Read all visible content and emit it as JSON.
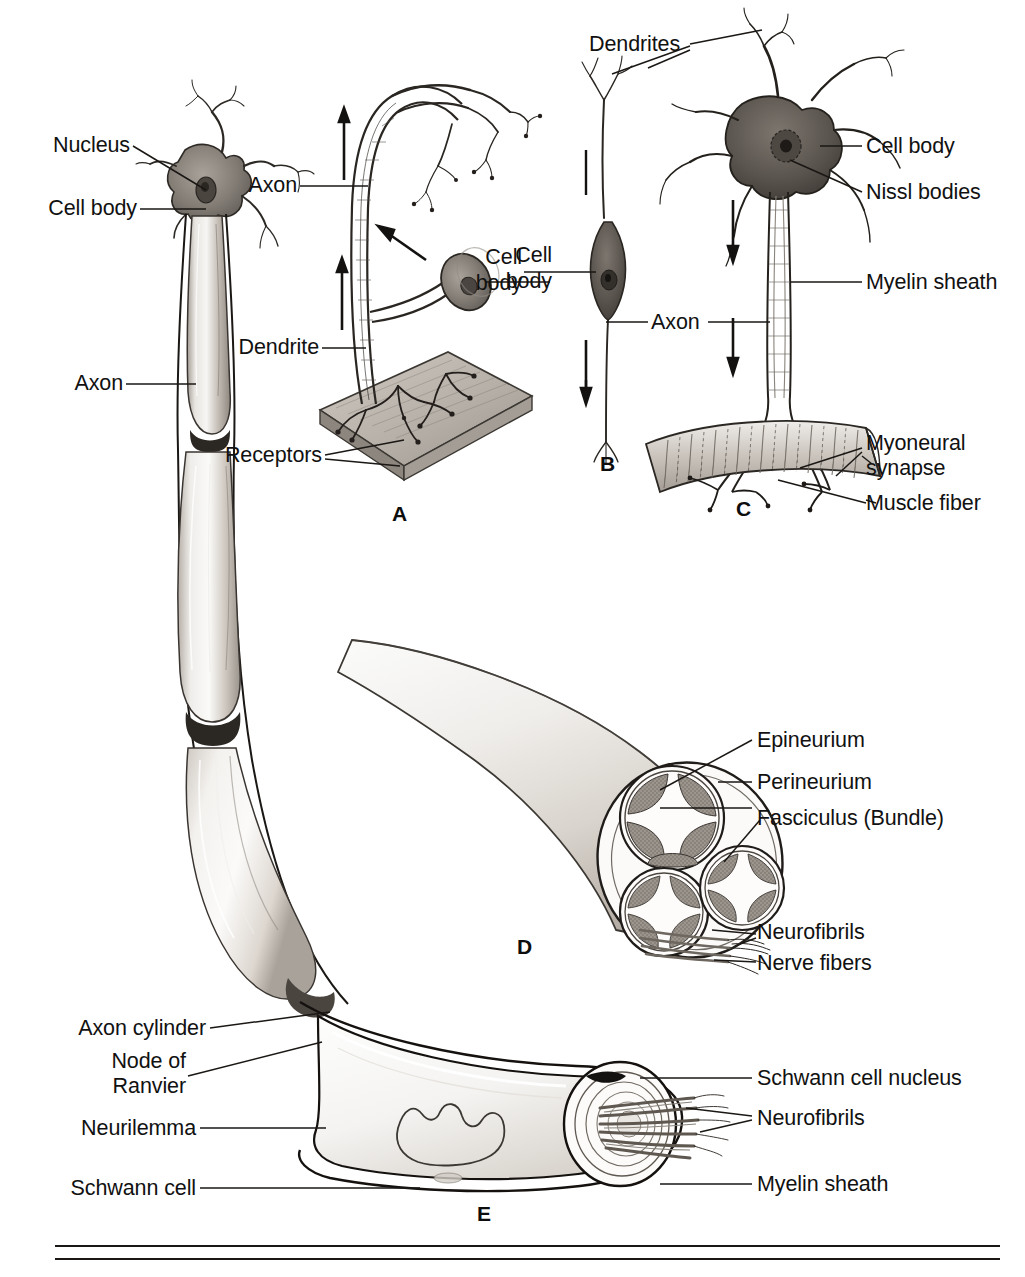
{
  "figure": {
    "background": "#ffffff",
    "ink": "#111111"
  },
  "panels": [
    {
      "id": "main",
      "letter": "",
      "caption": "Myelinated neuron with nodes of Ranvier"
    },
    {
      "id": "A",
      "letter": "A",
      "caption": "Sensory neuron with receptors"
    },
    {
      "id": "B",
      "letter": "B",
      "caption": "Bipolar neuron"
    },
    {
      "id": "C",
      "letter": "C",
      "caption": "Motor neuron ending on muscle fiber"
    },
    {
      "id": "D",
      "letter": "D",
      "caption": "Cross section of a peripheral nerve"
    },
    {
      "id": "E",
      "letter": "E",
      "caption": "Schwann cell and myelin sheath detail"
    }
  ],
  "labels": {
    "main": [
      {
        "key": "nucleus",
        "text": "Nucleus"
      },
      {
        "key": "cell_body",
        "text": "Cell body"
      },
      {
        "key": "axon",
        "text": "Axon"
      }
    ],
    "a": [
      {
        "key": "axon",
        "text": "Axon"
      },
      {
        "key": "dendrite",
        "text": "Dendrite"
      },
      {
        "key": "receptors",
        "text": "Receptors"
      },
      {
        "key": "cell_body_line1",
        "text": "Cell"
      },
      {
        "key": "cell_body_line2",
        "text": "body"
      }
    ],
    "b": [
      {
        "key": "dendrites",
        "text": "Dendrites"
      },
      {
        "key": "axon",
        "text": "Axon"
      }
    ],
    "c": [
      {
        "key": "cell_body",
        "text": "Cell body"
      },
      {
        "key": "nissl_bodies",
        "text": "Nissl bodies"
      },
      {
        "key": "myelin_sheath",
        "text": "Myelin sheath"
      },
      {
        "key": "myoneural_line1",
        "text": "Myoneural"
      },
      {
        "key": "myoneural_line2",
        "text": "synapse"
      },
      {
        "key": "muscle_fiber",
        "text": "Muscle fiber"
      }
    ],
    "d": [
      {
        "key": "epineurium",
        "text": "Epineurium"
      },
      {
        "key": "perineurium",
        "text": "Perineurium"
      },
      {
        "key": "fasciculus",
        "text": "Fasciculus (Bundle)"
      },
      {
        "key": "neurofibrils",
        "text": "Neurofibrils"
      },
      {
        "key": "nerve_fibers",
        "text": "Nerve fibers"
      }
    ],
    "e": [
      {
        "key": "axon_cylinder",
        "text": "Axon cylinder"
      },
      {
        "key": "node_line1",
        "text": "Node of"
      },
      {
        "key": "node_line2",
        "text": "Ranvier"
      },
      {
        "key": "neurilemma",
        "text": "Neurilemma"
      },
      {
        "key": "schwann_cell",
        "text": "Schwann cell"
      },
      {
        "key": "schwann_nucleus",
        "text": "Schwann cell nucleus"
      },
      {
        "key": "neurofibrils",
        "text": "Neurofibrils"
      },
      {
        "key": "myelin_sheath",
        "text": "Myelin sheath"
      }
    ]
  },
  "panel_letters": {
    "a": "A",
    "b": "B",
    "c": "C",
    "d": "D",
    "e": "E"
  },
  "colors": {
    "ink": "#111111",
    "leader": "#1a1a1a",
    "myelin_light": "#f2f0ee",
    "myelin_mid": "#c9c4be",
    "myelin_dark": "#8d867e",
    "node_dark": "#2b2723",
    "soma_gray": "#8f8a84",
    "soma_dark": "#4a4540",
    "fascicle_gray": "#9b958e",
    "sheath_white": "#fbfbfa",
    "muscle_gray": "#b5afa8",
    "plate_gray": "#b8b2ab"
  }
}
